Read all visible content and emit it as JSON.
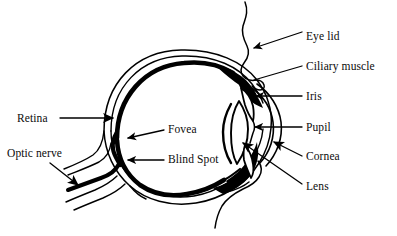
{
  "diagram": {
    "type": "anatomical-diagram",
    "ink_color": "#000000",
    "background_color": "#ffffff",
    "labels": {
      "eye_lid": "Eye lid",
      "ciliary_muscle": "Ciliary muscle",
      "iris": "Iris",
      "pupil": "Pupil",
      "cornea": "Cornea",
      "lens": "Lens",
      "retina": "Retina",
      "optic_nerve": "Optic nerve",
      "fovea": "Fovea",
      "blind_spot": "Blind Spot"
    },
    "parts": [
      {
        "name": "eye-lid",
        "label": "Eye lid",
        "side": "right",
        "leader": "arrow"
      },
      {
        "name": "ciliary-muscle",
        "label": "Ciliary muscle",
        "side": "right",
        "leader": "line"
      },
      {
        "name": "iris",
        "label": "Iris",
        "side": "right",
        "leader": "arrow"
      },
      {
        "name": "pupil",
        "label": "Pupil",
        "side": "right",
        "leader": "arrow"
      },
      {
        "name": "cornea",
        "label": "Cornea",
        "side": "right",
        "leader": "arrow"
      },
      {
        "name": "lens",
        "label": "Lens",
        "side": "right",
        "leader": "arrow"
      },
      {
        "name": "retina",
        "label": "Retina",
        "side": "left",
        "leader": "arrow"
      },
      {
        "name": "optic-nerve",
        "label": "Optic nerve",
        "side": "left",
        "leader": "arrow"
      },
      {
        "name": "fovea",
        "label": "Fovea",
        "side": "inside",
        "leader": "arrow"
      },
      {
        "name": "blind-spot",
        "label": "Blind Spot",
        "side": "inside",
        "leader": "arrow"
      }
    ]
  }
}
